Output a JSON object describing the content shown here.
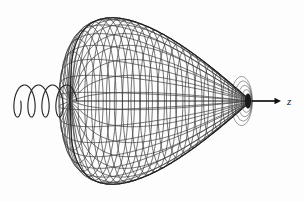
{
  "figure": {
    "background_color": "#fdfdfd",
    "width": 304,
    "height": 202
  },
  "surface": {
    "name": "wireframe-lobe",
    "description": "Egg-shaped wireframe surface of revolution about the horizontal z axis",
    "line_color": "#3a3a3a",
    "outline_color": "#1e1e1e",
    "left_x": 70,
    "right_x": 251,
    "top_y": 14,
    "bottom_y": 185,
    "axis_y": 101,
    "max_half_height": 85,
    "widest_x": 150,
    "parallel_count": 26,
    "meridian_count": 30,
    "taper_exponent": 2.05,
    "blunt_exponent": 0.62
  },
  "helix": {
    "name": "incident-wave-helix",
    "line_color": "#262626",
    "start_x": 14,
    "end_x": 70,
    "center_y": 101,
    "amplitude": 16,
    "loops": 4,
    "depth_ratio": 0.42
  },
  "axis": {
    "name": "z-axis",
    "label": "z",
    "label_x": 287,
    "label_y": 105,
    "arrow_start_x": 252,
    "arrow_end_x": 281,
    "arrow_y": 101,
    "arrow_color": "#111111",
    "pole_x": 250,
    "pole_y": 101,
    "pole_color": "#1a1a1a"
  },
  "caption": {
    "text": "clipped caption line — ascenders only, not legible",
    "visible_characters": ""
  }
}
